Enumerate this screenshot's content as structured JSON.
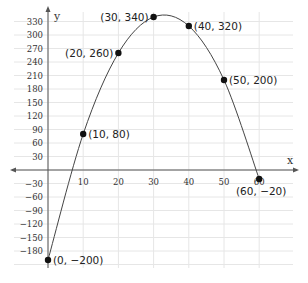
{
  "chart_data": {
    "type": "line",
    "title": "",
    "xlabel": "x",
    "ylabel": "y",
    "xlim": [
      -10,
      70
    ],
    "ylim": [
      -210,
      345
    ],
    "grid": true,
    "x_ticks": [
      10,
      20,
      30,
      40,
      50,
      60
    ],
    "x_tick_labels": [
      "10",
      "20",
      "30",
      "40",
      "50",
      "60"
    ],
    "y_ticks": [
      330,
      300,
      270,
      240,
      210,
      180,
      150,
      120,
      90,
      60,
      30,
      -30,
      -60,
      -90,
      -120,
      -150,
      -180
    ],
    "y_tick_labels": [
      "330",
      "300",
      "270",
      "240",
      "210",
      "180",
      "150",
      "120",
      "90",
      "60",
      "30",
      "−30",
      "−60",
      "−90",
      "−120",
      "−150",
      "−180"
    ],
    "series": [
      {
        "name": "curve",
        "points": [
          {
            "x": 0,
            "y": -200,
            "label": "(0, −200)"
          },
          {
            "x": 10,
            "y": 80,
            "label": "(10, 80)"
          },
          {
            "x": 20,
            "y": 260,
            "label": "(20, 260)"
          },
          {
            "x": 30,
            "y": 340,
            "label": "(30, 340)"
          },
          {
            "x": 40,
            "y": 320,
            "label": "(40, 320)"
          },
          {
            "x": 50,
            "y": 200,
            "label": "(50, 200)"
          },
          {
            "x": 60,
            "y": -20,
            "label": "(60, −20)"
          }
        ]
      }
    ]
  }
}
